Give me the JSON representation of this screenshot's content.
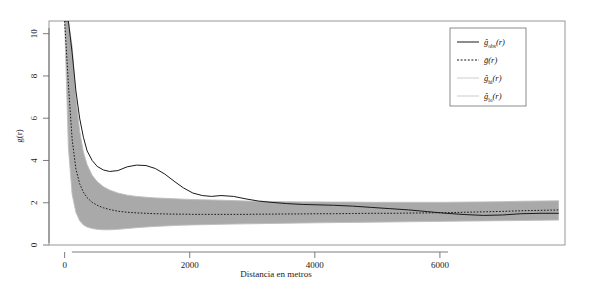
{
  "chart_data": {
    "type": "line",
    "title": "",
    "xlabel": "Distancia en metros",
    "ylabel": "g(r)",
    "xlim": [
      -250,
      8000
    ],
    "ylim": [
      0,
      10.6
    ],
    "xticks": [
      0,
      2000,
      4000,
      6000
    ],
    "xticklabels": [
      "0",
      "2000",
      "4000",
      "6000"
    ],
    "yticks": [
      0,
      2,
      4,
      6,
      8,
      10
    ],
    "yticklabels": [
      "0",
      "2",
      "4",
      "6",
      "8",
      "10"
    ],
    "grid": false,
    "legend_position": "top-right",
    "x": [
      0,
      60,
      120,
      180,
      240,
      300,
      360,
      440,
      520,
      620,
      720,
      850,
      1000,
      1150,
      1300,
      1450,
      1600,
      1750,
      1900,
      2050,
      2200,
      2350,
      2500,
      2700,
      2900,
      3100,
      3300,
      3550,
      3800,
      4050,
      4300,
      4600,
      4900,
      5200,
      5500,
      5800,
      6100,
      6400,
      6700,
      7000,
      7300,
      7600,
      7900
    ],
    "series": [
      {
        "name": "g_obs",
        "label": "ĝ_obs(r)",
        "style": "solid",
        "color": "#1a1a1a",
        "values": [
          10.6,
          10.6,
          9.1,
          7.3,
          6.0,
          5.1,
          4.45,
          4.0,
          3.72,
          3.55,
          3.48,
          3.52,
          3.7,
          3.78,
          3.76,
          3.62,
          3.36,
          3.02,
          2.7,
          2.46,
          2.34,
          2.3,
          2.34,
          2.3,
          2.18,
          2.08,
          2.02,
          1.96,
          1.92,
          1.9,
          1.88,
          1.84,
          1.78,
          1.72,
          1.66,
          1.58,
          1.5,
          1.44,
          1.4,
          1.42,
          1.48,
          1.5,
          1.5
        ]
      },
      {
        "name": "g_bar",
        "label": "ḡ(r)",
        "style": "dashed",
        "color": "#1a1a1a",
        "values": [
          10.6,
          7.6,
          5.0,
          3.6,
          2.9,
          2.5,
          2.24,
          2.02,
          1.88,
          1.76,
          1.68,
          1.6,
          1.55,
          1.52,
          1.5,
          1.48,
          1.47,
          1.46,
          1.46,
          1.45,
          1.45,
          1.45,
          1.45,
          1.45,
          1.45,
          1.46,
          1.46,
          1.47,
          1.47,
          1.48,
          1.48,
          1.49,
          1.5,
          1.5,
          1.51,
          1.52,
          1.53,
          1.55,
          1.57,
          1.59,
          1.62,
          1.64,
          1.66
        ]
      },
      {
        "name": "g_hi",
        "label": "ĝ_hi(r)",
        "style": "solid",
        "color": "#bdbdbd",
        "values": [
          10.6,
          10.6,
          9.4,
          7.0,
          5.4,
          4.4,
          3.8,
          3.3,
          3.0,
          2.76,
          2.6,
          2.46,
          2.36,
          2.3,
          2.26,
          2.23,
          2.21,
          2.19,
          2.17,
          2.15,
          2.14,
          2.13,
          2.12,
          2.1,
          2.08,
          2.07,
          2.06,
          2.05,
          2.04,
          2.04,
          2.03,
          2.03,
          2.02,
          2.02,
          2.02,
          2.02,
          2.02,
          2.03,
          2.04,
          2.05,
          2.07,
          2.08,
          2.09
        ]
      },
      {
        "name": "g_lo",
        "label": "ĝ_lo(r)",
        "style": "solid",
        "color": "#bdbdbd",
        "values": [
          10.6,
          4.6,
          2.4,
          1.55,
          1.15,
          0.95,
          0.85,
          0.78,
          0.74,
          0.72,
          0.72,
          0.74,
          0.78,
          0.82,
          0.85,
          0.88,
          0.9,
          0.92,
          0.94,
          0.95,
          0.96,
          0.97,
          0.98,
          0.99,
          1.0,
          1.01,
          1.02,
          1.03,
          1.04,
          1.05,
          1.06,
          1.07,
          1.08,
          1.09,
          1.1,
          1.11,
          1.12,
          1.13,
          1.14,
          1.15,
          1.16,
          1.17,
          1.18
        ]
      }
    ],
    "band": {
      "name": "simulation-envelope",
      "fill": "#a9a9a9",
      "upper_series": "g_hi",
      "lower_series": "g_lo"
    }
  },
  "legend": {
    "entries": [
      {
        "label_base": "g",
        "sub": "obs",
        "arg": "(r)",
        "hat": true,
        "style": "solid"
      },
      {
        "label_base": "g",
        "sub": "",
        "arg": "(r)",
        "hat": false,
        "style": "dashed"
      },
      {
        "label_base": "g",
        "sub": "hi",
        "arg": "(r)",
        "hat": true,
        "style": "solid-light"
      },
      {
        "label_base": "g",
        "sub": "lo",
        "arg": "(r)",
        "hat": true,
        "style": "solid-light"
      }
    ]
  },
  "axes": {
    "ylabel": "g(r)",
    "xlabel": "Distancia en metros"
  }
}
